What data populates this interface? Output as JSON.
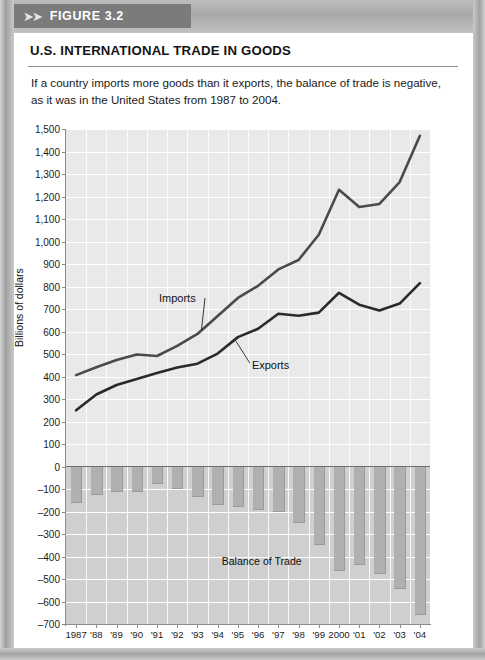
{
  "figure": {
    "tab_label": "FIGURE 3.2",
    "arrows": "➤➤",
    "title": "U.S. INTERNATIONAL TRADE IN GOODS",
    "subtitle": "If a country imports more goods than it exports, the balance of trade is negative, as it was in the United States from 1987 to 2004."
  },
  "chart_data": {
    "type": "line",
    "title": "U.S. INTERNATIONAL TRADE IN GOODS",
    "xlabel": "",
    "ylabel": "Billions of dollars",
    "ylim": [
      -700,
      1500
    ],
    "ytick_step": 100,
    "grid": true,
    "legend": "inline-annotation",
    "categories": [
      "1987",
      "'88",
      "'89",
      "'90",
      "'91",
      "'92",
      "'93",
      "'94",
      "'95",
      "'96",
      "'97",
      "'98",
      "'99",
      "2000",
      "'01",
      "'02",
      "'03",
      "'04"
    ],
    "x": [
      1987,
      1988,
      1989,
      1990,
      1991,
      1992,
      1993,
      1994,
      1995,
      1996,
      1997,
      1998,
      1999,
      2000,
      2001,
      2002,
      2003,
      2004
    ],
    "ytick_labels": [
      "1,500",
      "1,400",
      "1,300",
      "1,200",
      "1,100",
      "1,000",
      "900",
      "800",
      "700",
      "600",
      "500",
      "400",
      "300",
      "200",
      "100",
      "0",
      "–100",
      "–200",
      "–300",
      "–400",
      "–500",
      "–600",
      "–700"
    ],
    "ytick_values": [
      1500,
      1400,
      1300,
      1200,
      1100,
      1000,
      900,
      800,
      700,
      600,
      500,
      400,
      300,
      200,
      100,
      0,
      -100,
      -200,
      -300,
      -400,
      -500,
      -600,
      -700
    ],
    "series": [
      {
        "name": "Imports",
        "label": "Imports",
        "color": "#4a4a4a",
        "values": [
          406,
          441,
          473,
          498,
          491,
          536,
          589,
          669,
          749,
          803,
          876,
          918,
          1030,
          1230,
          1153,
          1167,
          1264,
          1470
        ]
      },
      {
        "name": "Exports",
        "label": "Exports",
        "color": "#2a2a2a",
        "values": [
          250,
          320,
          362,
          389,
          416,
          440,
          457,
          502,
          575,
          612,
          679,
          670,
          684,
          772,
          719,
          693,
          724,
          815
        ]
      },
      {
        "name": "Balance of Trade",
        "label": "Balance of Trade",
        "type": "bar",
        "color": "#b0b0b0",
        "values": [
          -156,
          -121,
          -111,
          -109,
          -75,
          -96,
          -132,
          -167,
          -174,
          -191,
          -197,
          -248,
          -346,
          -458,
          -434,
          -474,
          -540,
          -655
        ]
      }
    ],
    "annotations": [
      {
        "text": "Imports",
        "series": "Imports"
      },
      {
        "text": "Exports",
        "series": "Exports"
      },
      {
        "text": "Balance of Trade",
        "series": "Balance of Trade"
      }
    ]
  }
}
